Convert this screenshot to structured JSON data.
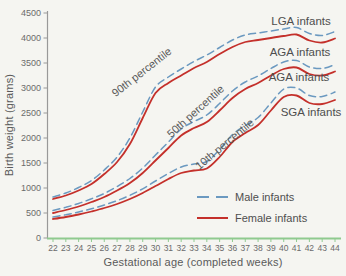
{
  "chart_data": {
    "type": "line",
    "title": "",
    "xlabel": "Gestational age (completed weeks)",
    "ylabel": "Birth weight (grams)",
    "x": [
      22,
      23,
      24,
      25,
      26,
      27,
      28,
      29,
      30,
      31,
      32,
      33,
      34,
      35,
      36,
      37,
      38,
      39,
      40,
      41,
      42,
      43,
      44
    ],
    "xlim": [
      22,
      44
    ],
    "ylim": [
      0,
      4500
    ],
    "y_ticks": [
      0,
      500,
      1000,
      1500,
      2000,
      2500,
      3000,
      3500,
      4000,
      4500
    ],
    "grid": false,
    "legend_position": "lower-right",
    "series": [
      {
        "name": "90th percentile male",
        "style": "dashed",
        "color": "#6b99c0",
        "values": [
          820,
          900,
          1010,
          1150,
          1360,
          1620,
          2000,
          2520,
          3020,
          3220,
          3380,
          3530,
          3660,
          3810,
          3960,
          4060,
          4100,
          4140,
          4180,
          4210,
          4090,
          4050,
          4130
        ]
      },
      {
        "name": "90th percentile female",
        "style": "solid",
        "color": "#c4302b",
        "values": [
          780,
          850,
          950,
          1080,
          1280,
          1520,
          1880,
          2400,
          2900,
          3100,
          3250,
          3400,
          3520,
          3680,
          3820,
          3920,
          3960,
          4000,
          4040,
          4070,
          3950,
          3910,
          3990
        ]
      },
      {
        "name": "50th percentile male",
        "style": "dashed",
        "color": "#6b99c0",
        "values": [
          550,
          615,
          690,
          785,
          890,
          1030,
          1190,
          1400,
          1660,
          1920,
          2180,
          2330,
          2460,
          2690,
          2940,
          3120,
          3240,
          3390,
          3520,
          3550,
          3420,
          3390,
          3470
        ]
      },
      {
        "name": "50th percentile female",
        "style": "solid",
        "color": "#c4302b",
        "values": [
          500,
          560,
          630,
          720,
          820,
          950,
          1100,
          1300,
          1550,
          1800,
          2050,
          2200,
          2320,
          2550,
          2800,
          2980,
          3100,
          3250,
          3380,
          3410,
          3280,
          3250,
          3330
        ]
      },
      {
        "name": "10th percentile male",
        "style": "dashed",
        "color": "#6b99c0",
        "values": [
          420,
          465,
          520,
          585,
          660,
          748,
          855,
          985,
          1140,
          1290,
          1420,
          1480,
          1530,
          1770,
          2070,
          2250,
          2410,
          2700,
          2980,
          3000,
          2850,
          2830,
          2920
        ]
      },
      {
        "name": "10th percentile female",
        "style": "solid",
        "color": "#c4302b",
        "values": [
          380,
          420,
          470,
          530,
          600,
          680,
          780,
          900,
          1040,
          1180,
          1300,
          1350,
          1390,
          1620,
          1920,
          2100,
          2260,
          2550,
          2820,
          2850,
          2700,
          2680,
          2760
        ]
      }
    ],
    "curve_labels": [
      {
        "text": "90th percentile",
        "x": 144,
        "y": 75,
        "rotation": -38
      },
      {
        "text": "50th percentile",
        "x": 198,
        "y": 114,
        "rotation": -42
      },
      {
        "text": "10th percentile",
        "x": 227,
        "y": 147,
        "rotation": -40
      }
    ],
    "region_labels": [
      {
        "text": "LGA infants",
        "x": 301,
        "y": 21
      },
      {
        "text": "AGA infants",
        "x": 300,
        "y": 52
      },
      {
        "text": "AGA infants",
        "x": 299,
        "y": 77
      },
      {
        "text": "SGA infants",
        "x": 311,
        "y": 112
      }
    ],
    "legend": [
      {
        "label": "Male infants",
        "style": "dashed",
        "color": "#6b99c0"
      },
      {
        "label": "Female infants",
        "style": "solid",
        "color": "#c4302b"
      }
    ]
  },
  "colors": {
    "male_line": "#6b99c0",
    "female_line": "#c4302b",
    "y_axis": "#999999",
    "x_axis": "#8fca8f",
    "tick_text": "#6b6b6b",
    "label_text": "#4e4e4e",
    "background": "#f5f5f1"
  }
}
